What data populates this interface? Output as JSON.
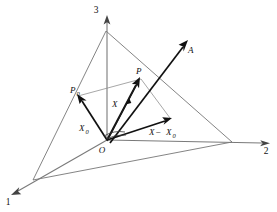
{
  "figure": {
    "background_color": "#ffffff",
    "ink_color": "#111111",
    "line_color": "#6e6e6e"
  },
  "axes": [
    {
      "name": "axis-1",
      "label": "1",
      "label_x": 8,
      "label_y": 202,
      "direction": "down-left"
    },
    {
      "name": "axis-2",
      "label": "2",
      "label_x": 266,
      "label_y": 154,
      "direction": "right"
    },
    {
      "name": "axis-3",
      "label": "3",
      "label_x": 96,
      "label_y": 13,
      "direction": "up"
    }
  ],
  "points": [
    {
      "name": "origin",
      "label": "O",
      "label_x": 102,
      "label_y": 152,
      "x": 107,
      "y": 140
    },
    {
      "name": "point-p0",
      "label": "P",
      "sub": "0",
      "label_x": 75,
      "label_y": 92,
      "x": 78,
      "y": 96
    },
    {
      "name": "point-p",
      "label": "P",
      "sub": "",
      "label_x": 137,
      "label_y": 74,
      "x": 141,
      "y": 79
    }
  ],
  "vectors": [
    {
      "name": "vector-x0",
      "label": "X",
      "sub": "0",
      "label_x": 83,
      "label_y": 130,
      "from": "O",
      "to": "P0"
    },
    {
      "name": "vector-x",
      "label": "X",
      "sub": "",
      "label_x": 114,
      "label_y": 105,
      "from": "O",
      "to": "P"
    },
    {
      "name": "vector-x-minus-x0",
      "label": "X",
      "op": " − ",
      "label2": "X",
      "sub2": "0",
      "label_x": 154,
      "label_y": 133,
      "from": "O",
      "to": "X-X0 endpoint"
    },
    {
      "name": "vector-a",
      "label": "A",
      "sub": "",
      "label_x": 186,
      "label_y": 51,
      "from": "near O",
      "to": "upper right"
    }
  ],
  "plane": {
    "name": "plane-triangle",
    "vertices": [
      {
        "x": 106,
        "y": 31
      },
      {
        "x": 232,
        "y": 142
      },
      {
        "x": 33,
        "y": 180
      }
    ]
  },
  "parallelogram": {
    "name": "vector-parallelogram",
    "vertices": [
      {
        "x": 107,
        "y": 140
      },
      {
        "x": 78,
        "y": 96
      },
      {
        "x": 141,
        "y": 79
      },
      {
        "x": 170,
        "y": 118
      }
    ]
  }
}
